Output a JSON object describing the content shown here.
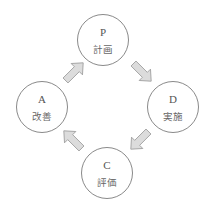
{
  "diagram": {
    "type": "cycle",
    "nodes": [
      {
        "id": "P",
        "letter": "P",
        "label": "計画",
        "cx": 103,
        "cy": 40
      },
      {
        "id": "D",
        "letter": "D",
        "label": "実施",
        "cx": 173,
        "cy": 107
      },
      {
        "id": "C",
        "letter": "C",
        "label": "評価",
        "cx": 107,
        "cy": 173
      },
      {
        "id": "A",
        "letter": "A",
        "label": "改善",
        "cx": 42,
        "cy": 107
      }
    ],
    "edges": [
      {
        "from": "P",
        "to": "D"
      },
      {
        "from": "D",
        "to": "C"
      },
      {
        "from": "C",
        "to": "A"
      },
      {
        "from": "A",
        "to": "P"
      }
    ],
    "colors": {
      "arrow_fill": "#dcdcdc",
      "arrow_stroke": "#9a9a9a",
      "circle_stroke": "#8a8a8a",
      "text": "#555555"
    }
  }
}
